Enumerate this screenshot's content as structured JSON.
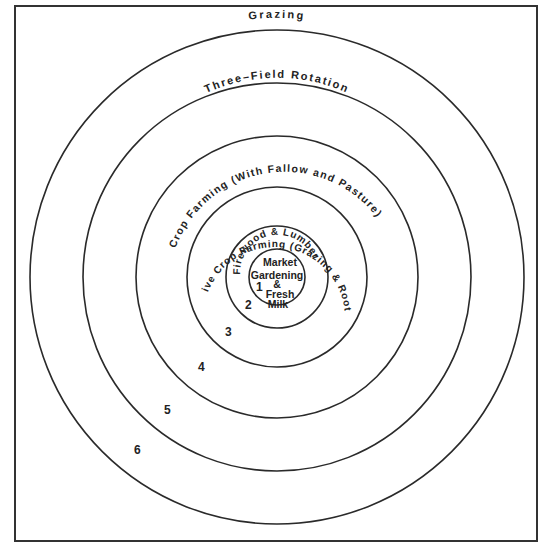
{
  "diagram": {
    "type": "concentric-zones",
    "center": {
      "x": 277,
      "y": 277
    },
    "rings": [
      {
        "zone": "1",
        "radius": 28,
        "label": "Market Gardening & Fresh Milk"
      },
      {
        "zone": "2",
        "radius": 51,
        "label": "Firewood & Lumber"
      },
      {
        "zone": "3",
        "radius": 90,
        "label": "Intensive Crop Farming (Grazing & Root Crops)"
      },
      {
        "zone": "4",
        "radius": 141,
        "label": "Crop Farming (With Fallow and Pasture)"
      },
      {
        "zone": "5",
        "radius": 194,
        "label": "Three-Field Rotation"
      },
      {
        "zone": "6",
        "radius": 247,
        "label": "Grazing"
      }
    ],
    "center_label_lines": [
      "Market",
      "Gardening",
      "&",
      "Fresh",
      "Milk"
    ],
    "arc_labels": {
      "zone2": "Firewood & Lumber",
      "zone3": "Intensive Crop Farming (Grazing & Root Crops)",
      "zone4": "Crop Farming (With Fallow and Pasture)",
      "zone5": "Three–Field Rotation",
      "zone6": "Grazing"
    },
    "zone_numbers": [
      "1",
      "2",
      "3",
      "4",
      "5",
      "6"
    ],
    "colors": {
      "line": "#2a2a2a",
      "text": "#222222",
      "background": "#ffffff"
    }
  }
}
